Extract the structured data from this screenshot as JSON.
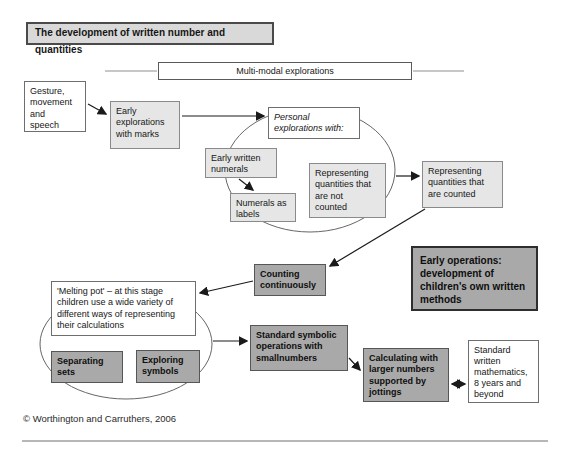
{
  "title": "The development of written number and quantities",
  "banner": {
    "label": "Multi-modal explorations"
  },
  "nodes": {
    "gesture": {
      "label": "Gesture,\nmovement\nand\nspeech",
      "style": "white"
    },
    "earlyMarks": {
      "label": "Early\nexplorations\nwith marks",
      "style": "light"
    },
    "personal": {
      "label": "Personal\nexplorations with:",
      "style": "white-italic"
    },
    "earlyWritten": {
      "label": "Early written\nnumerals",
      "style": "light"
    },
    "numeralsLabels": {
      "label": "Numerals as\nlabels",
      "style": "light"
    },
    "repNotCounted": {
      "label": "Representing\nquantities that\nare not\ncounted",
      "style": "light"
    },
    "repCounted": {
      "label": "Representing\nquantities that\nare counted",
      "style": "light"
    },
    "earlyOps": {
      "label": "Early operations:\ndevelopment of\nchildren's own written\nmethods",
      "style": "dark"
    },
    "counting": {
      "label": "Counting\ncontinuously",
      "style": "dark"
    },
    "meltingPot": {
      "label": "'Melting pot' – at this stage\nchildren use a wide variety of\ndifferent ways of representing\ntheir calculations",
      "style": "white"
    },
    "separatingSets": {
      "label": "Separating\nsets",
      "style": "dark"
    },
    "exploringSymbols": {
      "label": "Exploring\nsymbols",
      "style": "dark"
    },
    "stdSymbolic": {
      "label": "Standard symbolic\noperations with\nsmallnumbers",
      "style": "dark"
    },
    "calculating": {
      "label": "Calculating with\nlarger numbers\nsupported by\njottings",
      "style": "dark"
    },
    "stdWritten": {
      "label": "Standard\nwritten\nmathematics,\n8 years and\nbeyond",
      "style": "white"
    }
  },
  "footer": {
    "copyright": "© Worthington and Carruthers, 2006"
  },
  "colors": {
    "light_box_fill": "#e6e6e6",
    "dark_box_fill": "#a9a9a9",
    "title_box_fill": "#d9d9d9",
    "line": "#1a1a1a",
    "faint_line": "#b5b5b5"
  }
}
